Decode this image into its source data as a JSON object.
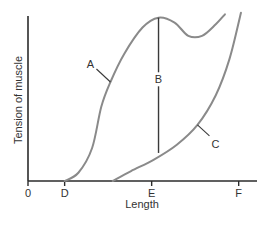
{
  "chart_data": {
    "type": "line",
    "title": "",
    "xlabel": "Length",
    "ylabel": "Tension of muscle",
    "x_ticks": [
      {
        "label": "0",
        "pos": 0.0
      },
      {
        "label": "D",
        "pos": 0.16
      },
      {
        "label": "E",
        "pos": 0.54
      },
      {
        "label": "F",
        "pos": 0.92
      }
    ],
    "xlim": [
      0,
      1
    ],
    "ylim": [
      0,
      1
    ],
    "grid": false,
    "legend": "none (curves labeled inline)",
    "series": [
      {
        "name": "A",
        "description": "Total tension",
        "color": "#8a8a8a",
        "points": [
          [
            0.16,
            0.0
          ],
          [
            0.22,
            0.05
          ],
          [
            0.28,
            0.2
          ],
          [
            0.32,
            0.45
          ],
          [
            0.36,
            0.6
          ],
          [
            0.42,
            0.77
          ],
          [
            0.5,
            0.93
          ],
          [
            0.57,
            0.99
          ],
          [
            0.64,
            0.96
          ],
          [
            0.7,
            0.88
          ],
          [
            0.76,
            0.88
          ],
          [
            0.82,
            0.95
          ],
          [
            0.86,
            1.01
          ]
        ]
      },
      {
        "name": "C",
        "description": "Passive tension",
        "color": "#8a8a8a",
        "points": [
          [
            0.37,
            0.0
          ],
          [
            0.45,
            0.06
          ],
          [
            0.55,
            0.13
          ],
          [
            0.65,
            0.22
          ],
          [
            0.74,
            0.34
          ],
          [
            0.82,
            0.52
          ],
          [
            0.88,
            0.74
          ],
          [
            0.93,
            1.02
          ]
        ]
      },
      {
        "name": "B",
        "description": "Active tension (difference A − C)",
        "type": "vertical-segment",
        "x": 0.57,
        "y_from": 0.17,
        "y_to": 0.99
      }
    ],
    "annotations": [
      {
        "text": "A",
        "target": "A"
      },
      {
        "text": "B",
        "target": "B"
      },
      {
        "text": "C",
        "target": "C"
      }
    ]
  }
}
